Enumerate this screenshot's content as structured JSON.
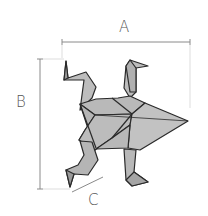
{
  "diagram": {
    "dimensions": {
      "a": {
        "label": "A",
        "meaning": "length"
      },
      "b": {
        "label": "B",
        "meaning": "height"
      },
      "c": {
        "label": "C",
        "meaning": "foot width"
      }
    },
    "colors": {
      "paper_fill": "#b9b9b9",
      "paper_fill_light": "#c7c7c7",
      "outline": "#2a2a2a",
      "dimension_line": "#8a8a8a",
      "label_text": "#555555"
    }
  }
}
